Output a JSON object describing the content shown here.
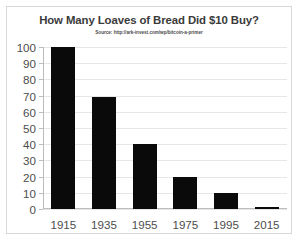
{
  "chart_data": {
    "type": "bar",
    "title": "How Many Loaves of Bread Did $10 Buy?",
    "subtitle": "Source: http://ark-invest.com/wp/bitcoin-a-primer",
    "categories": [
      "1915",
      "1935",
      "1955",
      "1975",
      "1995",
      "2015"
    ],
    "values": [
      100,
      69,
      40,
      20,
      10,
      1.5
    ],
    "series": [
      {
        "name": "Loaves of bread per $10",
        "values": [
          100,
          69,
          40,
          20,
          10,
          1.5
        ]
      }
    ],
    "xlabel": "",
    "ylabel": "",
    "ylim": [
      0,
      100
    ],
    "y_ticks": [
      0,
      10,
      20,
      30,
      40,
      50,
      60,
      70,
      80,
      90,
      100
    ],
    "y_tick_labels": [
      "0",
      "10",
      "20",
      "30",
      "40",
      "50",
      "60",
      "70",
      "80",
      "90",
      "100"
    ],
    "grid": true,
    "legend": false,
    "legend_position": "none",
    "bar_color": "#0a0a0a",
    "axis_color": "#bdbdbd",
    "grid_color": "#e6e6e6",
    "text_color": "#4d4d4d",
    "title_color": "#3b3b3b",
    "background_color": "#ffffff",
    "border_color": "#d8d8d8"
  }
}
